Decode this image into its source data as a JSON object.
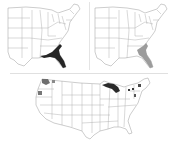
{
  "figure": {
    "panels": [
      {
        "id": "a",
        "description": "Eastern United States map with southeastern coastal region shaded dark",
        "highlight_region": "Florida and Georgia/South Carolina coast",
        "highlight_color": "#2a2a2a"
      },
      {
        "id": "b",
        "description": "Eastern United States map with southeastern coastal region shaded light gray",
        "highlight_region": "Florida and Atlantic coast",
        "highlight_color": "#9a9a9a"
      },
      {
        "id": "c",
        "description": "Contiguous United States map with scattered shaded regions in Pacific Northwest, Great Lakes and Northeast",
        "highlight_regions": [
          "Washington",
          "Oregon coast",
          "Upper Michigan / Great Lakes",
          "New England"
        ],
        "highlight_colors": [
          "#777777",
          "#2a2a2a"
        ]
      }
    ],
    "colors": {
      "background": "#ffffff",
      "state_border": "#9a9a9a",
      "divider": "#e0e0e0"
    }
  }
}
